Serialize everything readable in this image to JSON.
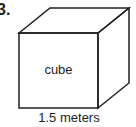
{
  "figure": {
    "problem_number": "3.",
    "shape_name": "cube",
    "face_label": "cube",
    "dimension_label": "1.5 meters",
    "dimension_value": "1.5",
    "dimension_unit": "meters",
    "stroke_color": "#231f20",
    "fill_color": "#ffffff",
    "background_color": "#ffffff",
    "geometry": {
      "front_top_left": "19,33",
      "front_top_right": "98,33",
      "front_bottom_right": "98,108",
      "front_bottom_left": "19,108",
      "back_top_left": "50,8",
      "back_top_right": "129,8",
      "back_bottom_right": "129,83",
      "front_face_points": "19,33 98,33 98,108 19,108",
      "top_face_points": "19,33 50,8 129,8 98,33",
      "right_face_points": "98,33 129,8 129,83 98,108"
    }
  }
}
